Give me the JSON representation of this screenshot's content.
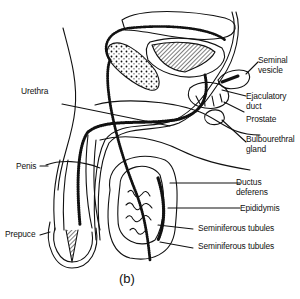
{
  "figure": {
    "caption": "(b)",
    "labels": {
      "seminal_vesicle_1": "Seminal",
      "seminal_vesicle_2": "vesicle",
      "ejaculatory_duct_1": "Ejaculatory",
      "ejaculatory_duct_2": "duct",
      "prostate": "Prostate",
      "bulbourethral_1": "Bulbourethral",
      "bulbourethral_2": "gland",
      "urethra": "Urethra",
      "penis": "Penis",
      "ductus_deferens_1": "Ductus",
      "ductus_deferens_2": "deferens",
      "epididymis": "Epididymis",
      "seminiferous_tubules_a": "Seminiferous tubules",
      "seminiferous_tubules_b": "Seminiferous tubules",
      "prepuce": "Prepuce"
    },
    "colors": {
      "ink": "#111111",
      "background": "#ffffff"
    }
  }
}
